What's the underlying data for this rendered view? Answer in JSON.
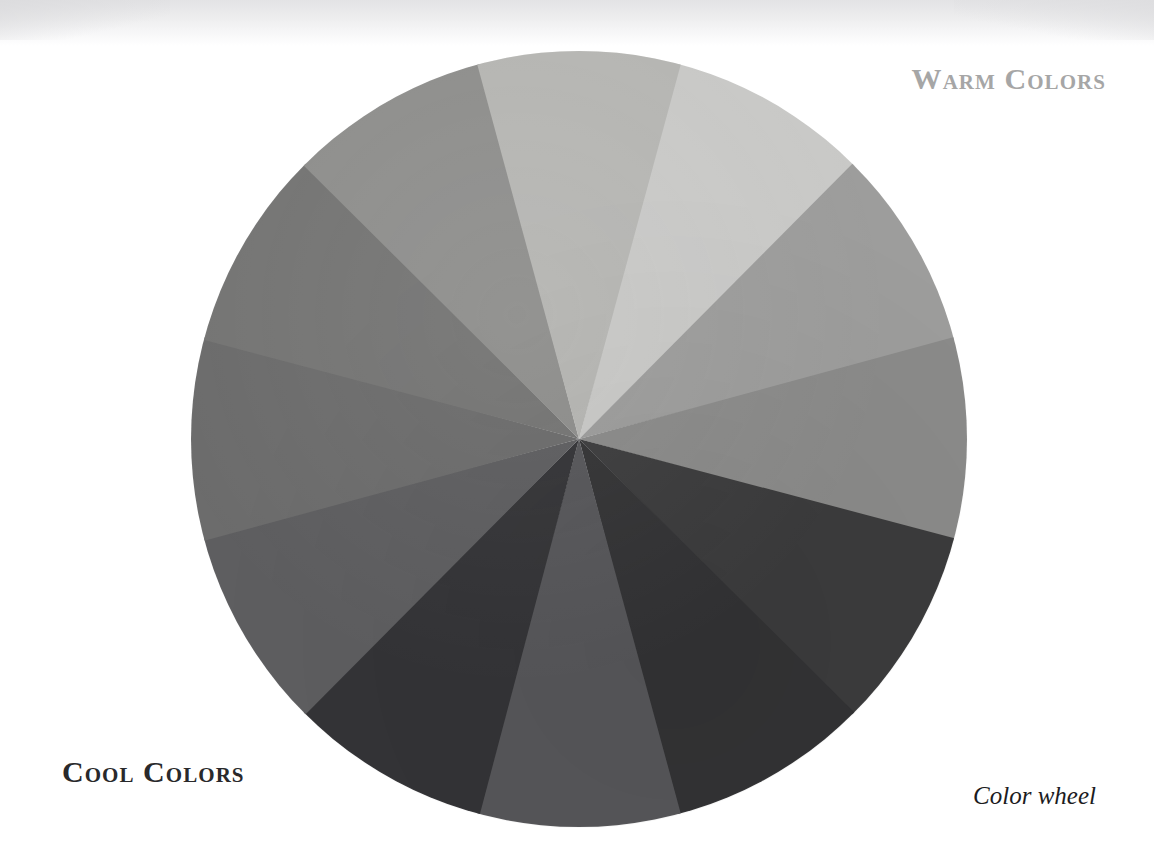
{
  "page": {
    "background_color": "#ffffff",
    "width": 1154,
    "height": 864
  },
  "labels": {
    "warm": "Warm Colors",
    "warm_color": "#a6a6a6",
    "cool": "Cool Colors",
    "cool_color": "#29292b",
    "caption": "Color wheel",
    "caption_color": "#1c1c1e"
  },
  "chart_data": {
    "type": "pie",
    "title": "Color wheel",
    "subtitle": "",
    "xlabel": "",
    "ylabel": "",
    "legend_position": "none",
    "grid": false,
    "note": "Twelve-hue color wheel reproduced in grayscale; every wedge is an equal 30 degree slice of the disc.",
    "center_x": 578,
    "center_y": 439,
    "radius": 389,
    "segment_count": 12,
    "segment_angle_deg": 30,
    "start_angle_deg": -105,
    "categories": [
      "Yellow",
      "Yellow-Orange",
      "Orange",
      "Red-Orange",
      "Red",
      "Red-Violet",
      "Violet",
      "Blue-Violet",
      "Blue",
      "Blue-Green",
      "Green",
      "Yellow-Green"
    ],
    "values": [
      30,
      30,
      30,
      30,
      30,
      30,
      30,
      30,
      30,
      30,
      30,
      30
    ],
    "colors": [
      "#ededeb",
      "#d2d2d0",
      "#a3a3a2",
      "#8d8d8c",
      "#7e7e7d",
      "#6e6e6d",
      "#4a4a4a",
      "#3a3a3b",
      "#36363a",
      "#4f4f52",
      "#5f5f60",
      "#717172",
      "#8a8a88",
      "#b4b4b1"
    ],
    "wedges": [
      {
        "name": "Yellow",
        "group": "Warm",
        "angle_start_deg": -105,
        "angle_end_deg": -75,
        "gray": "#ededeb"
      },
      {
        "name": "Yellow-Orange",
        "group": "Warm",
        "angle_start_deg": -75,
        "angle_end_deg": -45,
        "gray": "#c9c9c7"
      },
      {
        "name": "Orange",
        "group": "Warm",
        "angle_start_deg": -45,
        "angle_end_deg": -15,
        "gray": "#9d9d9c"
      },
      {
        "name": "Red-Orange",
        "group": "Warm",
        "angle_start_deg": -15,
        "angle_end_deg": 15,
        "gray": "#8b8b8a"
      },
      {
        "name": "Red",
        "group": "Warm",
        "angle_start_deg": 15,
        "angle_end_deg": 45,
        "gray": "#3c3c3d"
      },
      {
        "name": "Red-Violet",
        "group": "Warm",
        "angle_start_deg": 45,
        "angle_end_deg": 75,
        "gray": "#333335"
      },
      {
        "name": "Violet",
        "group": "Cool",
        "angle_start_deg": 75,
        "angle_end_deg": 105,
        "gray": "#57575a"
      },
      {
        "name": "Blue-Violet",
        "group": "Cool",
        "angle_start_deg": 105,
        "angle_end_deg": 135,
        "gray": "#343437"
      },
      {
        "name": "Blue",
        "group": "Cool",
        "angle_start_deg": 135,
        "angle_end_deg": 165,
        "gray": "#5e5e60"
      },
      {
        "name": "Blue-Green",
        "group": "Cool",
        "angle_start_deg": 165,
        "angle_end_deg": 195,
        "gray": "#6c6c6c"
      },
      {
        "name": "Green",
        "group": "Cool",
        "angle_start_deg": 195,
        "angle_end_deg": 225,
        "gray": "#757574"
      },
      {
        "name": "Yellow-Green",
        "group": "Cool",
        "angle_start_deg": 225,
        "angle_end_deg": 255,
        "gray": "#8f8f8d"
      },
      {
        "name": "Light Green",
        "group": "Cool",
        "angle_start_deg": 255,
        "angle_end_deg": 285,
        "gray": "#b6b6b3"
      }
    ]
  }
}
